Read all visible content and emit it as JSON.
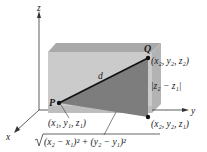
{
  "axes": {
    "x_label": "x",
    "y_label": "y",
    "z_label": "z"
  },
  "points": {
    "P": {
      "name": "P",
      "coords": "(x₁, y₁, z₁)"
    },
    "Q": {
      "name": "Q",
      "coords": "(x₂, y₂, z₂)"
    },
    "R": {
      "coords": "(x₂, y₂, z₁)"
    }
  },
  "labels": {
    "distance": "d",
    "vertical_leg": "|z₂ − z₁|",
    "horizontal_leg": "√(x₂ − x₁)² + (y₂ − y₁)²",
    "horizontal_leg_inner": "(x₂ − x₁)² + (y₂ − y₁)²"
  },
  "colors": {
    "box_front": "#c9c9c9",
    "box_top": "#a9a9a9",
    "box_side": "#b8b8b8",
    "triangle": "#7d7d7d",
    "line": "#111111"
  }
}
